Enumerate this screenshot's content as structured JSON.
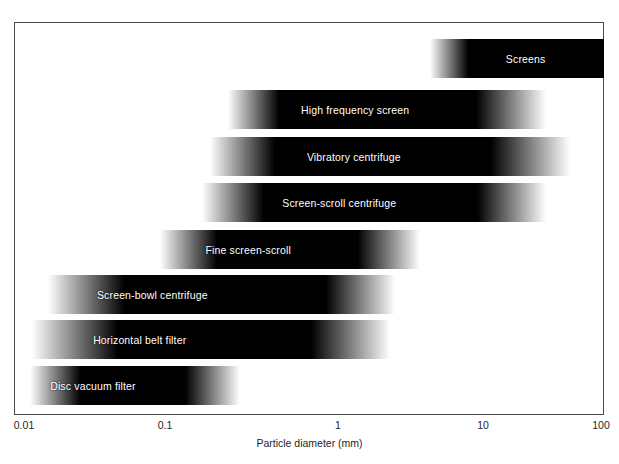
{
  "chart_data": {
    "type": "bar",
    "orientation": "horizontal",
    "title": "",
    "subtitle": "",
    "xlabel": "Particle diameter (mm)",
    "ylabel": "",
    "xscale": "log",
    "xlim": [
      0.01,
      100
    ],
    "xticks": [
      0.01,
      0.1,
      1,
      10,
      100
    ],
    "xticklabels": [
      "0.01",
      "0.1",
      "1",
      "10",
      "100"
    ],
    "grid": false,
    "legend": false,
    "legend_position": "none",
    "note": "Each bar spans the operating particle-size range of an equipment type; bars are black in the middle and fade to white at both ends (gradient edges indicate fuzzy range limits).",
    "categories": [
      "Screens",
      "High frequency screen",
      "Vibratory centrifuge",
      "Screen-scroll centrifuge",
      "Fine screen-scroll",
      "Screen-bowl centrifuge",
      "Horizontal belt filter",
      "Disc vacuum filter"
    ],
    "bars": [
      {
        "label": "Screens",
        "x_start_mm": 3.0,
        "x_end_mm": 100.0,
        "left_pct": 70.5,
        "width_pct": 29.5,
        "fade_left_pct": 22,
        "fade_right_pct": 0,
        "top_px": 17,
        "label_offset_pct": 55
      },
      {
        "label": "High frequency screen",
        "x_start_mm": 0.35,
        "x_end_mm": 27.0,
        "left_pct": 36.3,
        "width_pct": 53.8,
        "fade_left_pct": 16,
        "fade_right_pct": 22,
        "top_px": 68,
        "label_offset_pct": 40
      },
      {
        "label": "Vibratory centrifuge",
        "x_start_mm": 0.25,
        "x_end_mm": 45.0,
        "left_pct": 33.2,
        "width_pct": 61.0,
        "fade_left_pct": 18,
        "fade_right_pct": 22,
        "top_px": 115,
        "label_offset_pct": 40
      },
      {
        "label": "Screen-scroll centrifuge",
        "x_start_mm": 0.21,
        "x_end_mm": 30.0,
        "left_pct": 31.8,
        "width_pct": 58.3,
        "fade_left_pct": 18,
        "fade_right_pct": 20,
        "top_px": 161,
        "label_offset_pct": 40
      },
      {
        "label": "Fine screen-scroll",
        "x_start_mm": 0.1,
        "x_end_mm": 2.2,
        "left_pct": 24.7,
        "width_pct": 44.1,
        "fade_left_pct": 22,
        "fade_right_pct": 24,
        "top_px": 208,
        "label_offset_pct": 34
      },
      {
        "label": "Screen-bowl centrifuge",
        "x_start_mm": 0.018,
        "x_end_mm": 1.5,
        "left_pct": 5.8,
        "width_pct": 58.8,
        "fade_left_pct": 22,
        "fade_right_pct": 20,
        "top_px": 253,
        "label_offset_pct": 30
      },
      {
        "label": "Horizontal belt filter",
        "x_start_mm": 0.013,
        "x_end_mm": 1.4,
        "left_pct": 3.1,
        "width_pct": 60.7,
        "fade_left_pct": 24,
        "fade_right_pct": 22,
        "top_px": 298,
        "label_offset_pct": 30
      },
      {
        "label": "Disc vacuum filter",
        "x_start_mm": 0.012,
        "x_end_mm": 0.33,
        "left_pct": 2.7,
        "width_pct": 35.6,
        "fade_left_pct": 24,
        "fade_right_pct": 26,
        "top_px": 344,
        "label_offset_pct": 30
      }
    ],
    "colors": {
      "bar_core": "#000000",
      "bar_fade": "#ffffff",
      "label_text": "#ffffff",
      "axis": "#4a4a4a",
      "background": "#ffffff"
    }
  },
  "axis": {
    "ticks": [
      {
        "label": "0.01",
        "left_px": 24
      },
      {
        "label": "0.1",
        "left_px": 165
      },
      {
        "label": "1",
        "left_px": 338
      },
      {
        "label": "10",
        "left_px": 483
      },
      {
        "label": "100",
        "left_px": 601
      }
    ],
    "title": "Particle diameter (mm)"
  }
}
